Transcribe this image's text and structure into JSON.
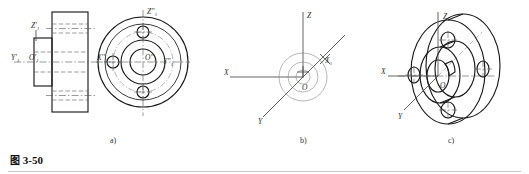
{
  "figure": {
    "caption_cjk": "图",
    "caption_number": "3-50",
    "sub_labels": {
      "a": "a)",
      "b": "b)",
      "c": "c)"
    }
  },
  "colors": {
    "outline": "#1a1a1a",
    "centerline": "#555555",
    "hidden": "#666666",
    "axis": "#4a4a4a",
    "background": "#ffffff",
    "rule": "#c9c9c9",
    "label": "#333333"
  },
  "part_a": {
    "title": "orthographic-views",
    "front_view_labels": {
      "z_axis": "Z'₁",
      "y_axis": "Y'₁",
      "origin": "O'₁"
    },
    "end_view_labels": {
      "z_axis": "Z''₁",
      "x_axis": "X''₁",
      "origin": "O''₁",
      "y_axis": "Y''₁"
    },
    "bolt_hole_count": "4"
  },
  "part_b": {
    "title": "axonometric-axes-setup",
    "axis_labels": {
      "z": "Z",
      "x": "X",
      "y": "Y",
      "x1": "X₁",
      "origin": "O"
    }
  },
  "part_c": {
    "title": "completed-axonometric-view",
    "axis_labels": {
      "z": "Z",
      "x": "X",
      "y": "Y",
      "origin": "O"
    },
    "bolt_hole_count": "4"
  }
}
